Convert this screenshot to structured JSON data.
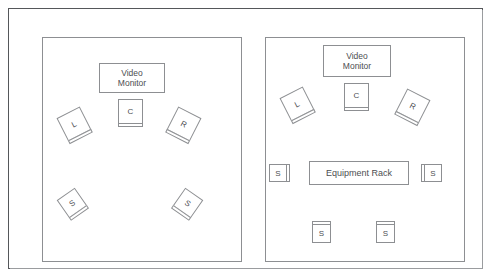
{
  "diagram": {
    "colors": {
      "line": "#8d8f92",
      "frame": "#55575a",
      "text": "#4c4e51",
      "background": "#ffffff"
    }
  },
  "rooms": [
    {
      "name": "left-room",
      "monitor": {
        "label": "Video\nMonitor",
        "x": 98,
        "y": 62,
        "w": 66,
        "h": 30
      },
      "speakers": [
        {
          "id": "center",
          "label": "C",
          "x": 117,
          "y": 98,
          "size": 25,
          "rotation": 0,
          "face": "bottom"
        },
        {
          "id": "left-front",
          "label": "L",
          "x": 60,
          "y": 110,
          "size": 26,
          "rotation": -27,
          "face": "bottom"
        },
        {
          "id": "right-front",
          "label": "R",
          "x": 170,
          "y": 110,
          "size": 26,
          "rotation": 27,
          "face": "bottom"
        },
        {
          "id": "surround-left",
          "label": "S",
          "x": 60,
          "y": 191,
          "size": 22,
          "rotation": -35,
          "face": "bottom"
        },
        {
          "id": "surround-right",
          "label": "S",
          "x": 176,
          "y": 191,
          "size": 22,
          "rotation": 35,
          "face": "bottom"
        }
      ]
    },
    {
      "name": "right-room",
      "monitor": {
        "label": "Video\nMonitor",
        "x": 322,
        "y": 44,
        "w": 68,
        "h": 32
      },
      "rack": {
        "label": "Equipment Rack",
        "x": 308,
        "y": 160,
        "w": 100,
        "h": 24
      },
      "speakers": [
        {
          "id": "center",
          "label": "C",
          "x": 343,
          "y": 82,
          "size": 25,
          "rotation": 0,
          "face": "bottom"
        },
        {
          "id": "left-front",
          "label": "L",
          "x": 283,
          "y": 90,
          "size": 26,
          "rotation": -27,
          "face": "bottom"
        },
        {
          "id": "right-front",
          "label": "R",
          "x": 399,
          "y": 92,
          "size": 26,
          "rotation": 27,
          "face": "bottom"
        },
        {
          "id": "surround-side-left",
          "label": "S",
          "x": 268,
          "y": 163,
          "size": 18,
          "rotation": 0,
          "face": "right"
        },
        {
          "id": "surround-side-right",
          "label": "S",
          "x": 423,
          "y": 163,
          "size": 18,
          "rotation": 0,
          "face": "left"
        },
        {
          "id": "surround-rear-left",
          "label": "S",
          "x": 311,
          "y": 223,
          "size": 19,
          "rotation": 0,
          "face": "top"
        },
        {
          "id": "surround-rear-right",
          "label": "S",
          "x": 375,
          "y": 223,
          "size": 19,
          "rotation": 0,
          "face": "top"
        }
      ]
    }
  ]
}
